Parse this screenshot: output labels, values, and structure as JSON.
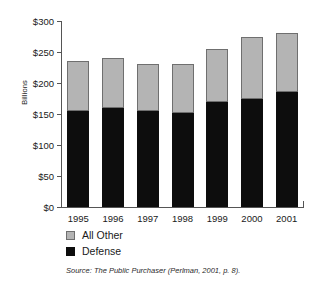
{
  "chart_data": {
    "type": "bar",
    "subtype": "stacked-vertical",
    "title": "",
    "xlabel": "",
    "ylabel": "Billions",
    "categories": [
      "1995",
      "1996",
      "1997",
      "1998",
      "1999",
      "2000",
      "2001"
    ],
    "series": [
      {
        "name": "Defense",
        "color": "#0d0d0d",
        "values": [
          155,
          160,
          155,
          152,
          170,
          175,
          185
        ]
      },
      {
        "name": "All Other",
        "color": "#b4b4b4",
        "values": [
          80,
          80,
          75,
          78,
          85,
          100,
          95
        ]
      }
    ],
    "totals": [
      235,
      240,
      230,
      230,
      255,
      275,
      280
    ],
    "ylim": [
      0,
      300
    ],
    "ytick_values": [
      0,
      50,
      100,
      150,
      200,
      250,
      300
    ],
    "ytick_labels": [
      "$0",
      "$50",
      "$100",
      "$150",
      "$200",
      "$250",
      "$300"
    ],
    "grid": false,
    "legend_position": "bottom-left",
    "legend": [
      "All Other",
      "Defense"
    ],
    "annotations": [
      "Source: The Public Purchaser (Perlman, 2001, p. 8)."
    ]
  },
  "axis": {
    "y_title": "Billions"
  },
  "legend": {
    "items": [
      {
        "label": "All Other",
        "swatch": "gray-swatch-icon"
      },
      {
        "label": "Defense",
        "swatch": "black-swatch-icon"
      }
    ]
  },
  "source": {
    "text": "Source: The Public Purchaser (Perlman, 2001, p. 8)."
  }
}
